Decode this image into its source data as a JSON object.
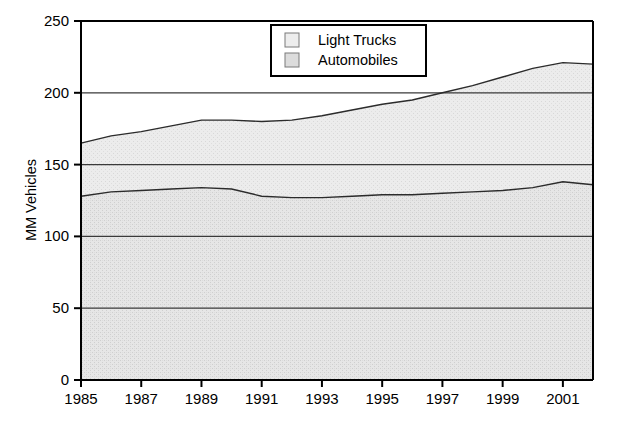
{
  "chart_data": {
    "type": "area",
    "title": "",
    "subtitle": "",
    "xlabel": "",
    "ylabel": "MM Vehicles",
    "stacked": true,
    "grid": true,
    "legend_position": "top-right",
    "xlim": [
      1985,
      2002
    ],
    "ylim": [
      0,
      250
    ],
    "x_tick_labels": [
      "1985",
      "1987",
      "1989",
      "1991",
      "1993",
      "1995",
      "1997",
      "1999",
      "2001"
    ],
    "x_ticks": [
      1985,
      1987,
      1989,
      1991,
      1993,
      1995,
      1997,
      1999,
      2001
    ],
    "y_tick_labels": [
      "0",
      "50",
      "100",
      "150",
      "200",
      "250"
    ],
    "y_ticks": [
      0,
      50,
      100,
      150,
      200,
      250
    ],
    "x": [
      1985,
      1986,
      1987,
      1988,
      1989,
      1990,
      1991,
      1992,
      1993,
      1994,
      1995,
      1996,
      1997,
      1998,
      1999,
      2000,
      2001,
      2002
    ],
    "series": [
      {
        "name": "Automobiles",
        "order": 0,
        "fill": "#e3e3e3",
        "values": [
          128,
          131,
          132,
          133,
          134,
          133,
          128,
          127,
          127,
          128,
          129,
          129,
          130,
          131,
          132,
          134,
          138,
          136
        ]
      },
      {
        "name": "Light Trucks",
        "order": 1,
        "fill": "#ebebeb",
        "values": [
          37,
          39,
          41,
          44,
          47,
          48,
          52,
          54,
          57,
          60,
          63,
          66,
          70,
          74,
          79,
          83,
          83,
          84
        ]
      }
    ],
    "totals": [
      165,
      170,
      173,
      177,
      181,
      181,
      180,
      181,
      184,
      188,
      192,
      195,
      200,
      205,
      211,
      217,
      221,
      220
    ]
  },
  "legend": {
    "items": [
      {
        "label": "Light Trucks",
        "swatch": "#ededed"
      },
      {
        "label": "Automobiles",
        "swatch": "#dcdcdc"
      }
    ]
  },
  "colors": {
    "axis": "#000000",
    "gridline": "#3a3a3a",
    "series_line": "#2b2b2b",
    "background": "#ffffff",
    "automobiles_fill": "#e3e3e3",
    "light_trucks_fill": "#ebebeb"
  }
}
